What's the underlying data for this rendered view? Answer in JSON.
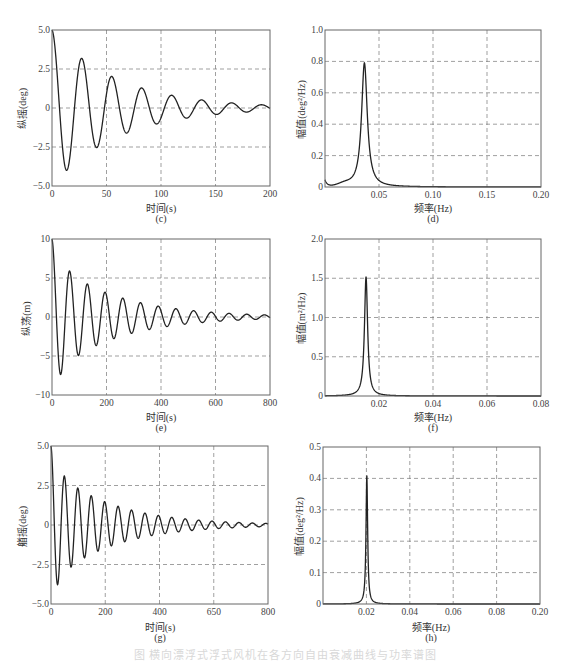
{
  "figure": {
    "caption": "图  横向漂浮式浮式风机在各方向自由衰减曲线与功率谱图"
  },
  "chart_data": [
    {
      "id": "c",
      "type": "line",
      "panel_label": "(c)",
      "title": "",
      "xlabel": "时间(s)",
      "ylabel": "纵摇(deg)",
      "xlim": [
        0,
        200
      ],
      "ylim": [
        -5.0,
        5.0
      ],
      "xticks": [
        0,
        50,
        100,
        150,
        200
      ],
      "xtick_labels": [
        "0",
        "50",
        "100",
        "150",
        "200"
      ],
      "yticks": [
        -5.0,
        -2.5,
        0,
        2.5,
        5.0
      ],
      "ytick_labels": [
        "-5.0",
        "-2.5",
        "0",
        "2.5",
        "5.0"
      ],
      "grid": "dashed",
      "signal": {
        "kind": "damped_cosine",
        "A0": 5.0,
        "period": 27.5,
        "decay": 0.0165
      },
      "key_points": [
        [
          0,
          5.0
        ],
        [
          14,
          -4.1
        ],
        [
          28,
          2.8
        ],
        [
          42,
          -2.5
        ],
        [
          55,
          1.7
        ],
        [
          69,
          -1.6
        ],
        [
          83,
          0.9
        ],
        [
          97,
          -1.1
        ],
        [
          111,
          0.5
        ],
        [
          124,
          -0.7
        ],
        [
          138,
          0.25
        ],
        [
          152,
          -0.55
        ],
        [
          166,
          0.05
        ],
        [
          180,
          -0.4
        ],
        [
          194,
          -0.05
        ],
        [
          200,
          -0.2
        ]
      ]
    },
    {
      "id": "d",
      "type": "line",
      "panel_label": "(d)",
      "title": "",
      "xlabel": "频率(Hz)",
      "ylabel": "幅值(deg²/Hz)",
      "xlim": [
        0,
        0.2
      ],
      "ylim": [
        0,
        1.0
      ],
      "xticks": [
        0.05,
        0.1,
        0.15,
        0.2
      ],
      "xtick_labels": [
        "0.05",
        "0.10",
        "0.15",
        "0.20"
      ],
      "yticks": [
        0,
        0.2,
        0.4,
        0.6,
        0.8,
        1.0
      ],
      "ytick_labels": [
        "0",
        "0.2",
        "0.4",
        "0.6",
        "0.8",
        "1.0"
      ],
      "grid": "dashed",
      "signal": {
        "kind": "psd_peak",
        "f0": 0.0365,
        "peak": 0.79,
        "width": 0.0032,
        "low_bump": 0.04
      },
      "key_points": [
        [
          0.0,
          0.04
        ],
        [
          0.005,
          0.0
        ],
        [
          0.02,
          0.02
        ],
        [
          0.03,
          0.12
        ],
        [
          0.0365,
          0.79
        ],
        [
          0.042,
          0.12
        ],
        [
          0.05,
          0.04
        ],
        [
          0.07,
          0.01
        ],
        [
          0.1,
          0.003
        ],
        [
          0.2,
          0.0
        ]
      ]
    },
    {
      "id": "e",
      "type": "line",
      "panel_label": "(e)",
      "title": "",
      "xlabel": "时间(s)",
      "ylabel": "纵荡(m)",
      "xlim": [
        0,
        800
      ],
      "ylim": [
        -10,
        10
      ],
      "xticks": [
        0,
        200,
        400,
        600,
        800
      ],
      "xtick_labels": [
        "0",
        "200",
        "400",
        "600",
        "800"
      ],
      "yticks": [
        -10,
        -5,
        0,
        5,
        10
      ],
      "ytick_labels": [
        "-10",
        "-5",
        "0",
        "5",
        "10"
      ],
      "grid": "dashed",
      "signal": {
        "kind": "damped_cosine",
        "A0": 10.0,
        "period": 65,
        "decay": 0.0042,
        "early_boost": true
      },
      "key_points": [
        [
          0,
          10
        ],
        [
          33,
          -7.0
        ],
        [
          66,
          5.1
        ],
        [
          99,
          -4.0
        ],
        [
          132,
          3.5
        ],
        [
          165,
          -2.7
        ],
        [
          198,
          2.5
        ],
        [
          231,
          -1.9
        ],
        [
          264,
          2.0
        ],
        [
          297,
          -1.4
        ],
        [
          330,
          1.6
        ],
        [
          363,
          -1.2
        ],
        [
          396,
          1.3
        ],
        [
          429,
          -0.9
        ],
        [
          462,
          1.0
        ],
        [
          495,
          -0.7
        ],
        [
          528,
          0.8
        ],
        [
          561,
          -0.5
        ],
        [
          594,
          0.7
        ],
        [
          627,
          -0.4
        ],
        [
          660,
          0.5
        ],
        [
          693,
          -0.35
        ],
        [
          726,
          0.45
        ],
        [
          759,
          -0.3
        ],
        [
          792,
          0.4
        ],
        [
          800,
          -0.1
        ]
      ]
    },
    {
      "id": "f",
      "type": "line",
      "panel_label": "(f)",
      "title": "",
      "xlabel": "频率(Hz)",
      "ylabel": "幅值(m²/Hz)",
      "xlim": [
        0,
        0.08
      ],
      "ylim": [
        0,
        2.0
      ],
      "xticks": [
        0.02,
        0.04,
        0.06,
        0.08
      ],
      "xtick_labels": [
        "0.02",
        "0.04",
        "0.06",
        "0.08"
      ],
      "yticks": [
        0,
        0.5,
        1.0,
        1.5,
        2.0
      ],
      "ytick_labels": [
        "0",
        "0.5",
        "1.0",
        "1.5",
        "2.0"
      ],
      "grid": "dashed",
      "signal": {
        "kind": "psd_peak",
        "f0": 0.0152,
        "peak": 1.52,
        "width": 0.0007,
        "low_bump": 0
      },
      "key_points": [
        [
          0.0,
          0.0
        ],
        [
          0.01,
          0.05
        ],
        [
          0.014,
          0.4
        ],
        [
          0.0152,
          1.52
        ],
        [
          0.0165,
          0.5
        ],
        [
          0.02,
          0.08
        ],
        [
          0.03,
          0.01
        ],
        [
          0.08,
          0.0
        ]
      ]
    },
    {
      "id": "g",
      "type": "line",
      "panel_label": "(g)",
      "title": "",
      "xlabel": "时间(s)",
      "ylabel": "艏摇(deg)",
      "xlim": [
        0,
        800
      ],
      "ylim": [
        -5.0,
        5.0
      ],
      "xticks": [
        0,
        200,
        400,
        600,
        800
      ],
      "xtick_labels": [
        "0",
        "200",
        "400",
        "650",
        "800"
      ],
      "yticks": [
        -5.0,
        -2.5,
        0,
        2.5,
        5.0
      ],
      "ytick_labels": [
        "-5.0",
        "-2.5",
        "0",
        "2.5",
        "5.0"
      ],
      "grid": "dashed",
      "signal": {
        "kind": "damped_cosine",
        "A0": 5.0,
        "period": 49.5,
        "decay": 0.0045,
        "early_boost": true
      },
      "key_points": [
        [
          0,
          5.0
        ],
        [
          25,
          -3.8
        ],
        [
          50,
          3.0
        ],
        [
          75,
          -2.4
        ],
        [
          100,
          2.0
        ],
        [
          125,
          -1.6
        ],
        [
          150,
          1.4
        ],
        [
          175,
          -1.2
        ],
        [
          200,
          1.1
        ],
        [
          225,
          -0.95
        ],
        [
          250,
          0.9
        ],
        [
          275,
          -0.75
        ],
        [
          300,
          0.75
        ],
        [
          350,
          0.65
        ],
        [
          400,
          0.55
        ],
        [
          450,
          0.45
        ],
        [
          500,
          0.35
        ],
        [
          550,
          0.3
        ],
        [
          600,
          0.28
        ],
        [
          650,
          0.25
        ],
        [
          700,
          0.2
        ],
        [
          750,
          0.2
        ],
        [
          800,
          0.15
        ]
      ]
    },
    {
      "id": "h",
      "type": "line",
      "panel_label": "(h)",
      "title": "",
      "xlabel": "频率(Hz)",
      "ylabel": "幅值(deg²/Hz)",
      "xlim": [
        0,
        0.1
      ],
      "ylim": [
        0,
        0.5
      ],
      "xticks": [
        0.02,
        0.04,
        0.06,
        0.08,
        0.1
      ],
      "xtick_labels": [
        "0.02",
        "0.04",
        "0.06",
        "0.08",
        "0.20"
      ],
      "yticks": [
        0,
        0.1,
        0.2,
        0.3,
        0.4,
        0.5
      ],
      "ytick_labels": [
        "0",
        "0.1",
        "0.2",
        "0.3",
        "0.4",
        "0.5"
      ],
      "grid": "dashed",
      "signal": {
        "kind": "psd_peak",
        "f0": 0.0202,
        "peak": 0.41,
        "width": 0.00045,
        "low_bump": 0
      },
      "key_points": [
        [
          0.0,
          0.0
        ],
        [
          0.015,
          0.01
        ],
        [
          0.019,
          0.08
        ],
        [
          0.0202,
          0.41
        ],
        [
          0.0215,
          0.1
        ],
        [
          0.03,
          0.01
        ],
        [
          0.04,
          0.002
        ],
        [
          0.1,
          0.0
        ]
      ]
    }
  ]
}
